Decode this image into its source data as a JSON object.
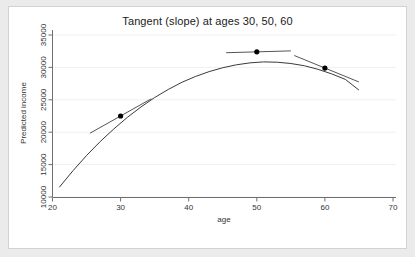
{
  "figure": {
    "background_color": "#ebebeb",
    "plot_background_color": "#ffffff",
    "border_color": "#d2d2d2"
  },
  "chart_data": {
    "type": "line",
    "title": "Tangent (slope) at ages 30, 50, 60",
    "xlabel": "age",
    "ylabel": "Predicted income",
    "xlim": [
      20,
      70
    ],
    "ylim": [
      10000,
      35000
    ],
    "xticks": [
      20,
      30,
      40,
      50,
      60,
      70
    ],
    "xtick_labels": [
      "20",
      "30",
      "40",
      "50",
      "60",
      "70"
    ],
    "yticks": [
      10000,
      15000,
      20000,
      25000,
      30000,
      35000
    ],
    "ytick_labels": [
      "10000",
      "15000",
      "20000",
      "25000",
      "30000",
      "35000"
    ],
    "grid": "horizontal",
    "legend": "none",
    "series": [
      {
        "name": "Predicted income (quadratic fit)",
        "type": "line",
        "color": "#3a3a3a",
        "x": [
          21,
          23,
          25,
          27,
          29,
          31,
          33,
          35,
          37,
          39,
          41,
          43,
          45,
          47,
          49,
          51,
          53,
          55,
          57,
          59,
          61,
          63,
          65
        ],
        "y": [
          11500,
          14050,
          16400,
          18550,
          20500,
          22300,
          23900,
          25350,
          26600,
          27700,
          28600,
          29350,
          29950,
          30400,
          30700,
          30850,
          30800,
          30600,
          30250,
          29700,
          29000,
          28150,
          26500
        ]
      }
    ],
    "markers": [
      {
        "label": "age 30",
        "x": 30,
        "y": 22500,
        "color": "#000000"
      },
      {
        "label": "age 50",
        "x": 50,
        "y": 32400,
        "color": "#000000"
      },
      {
        "label": "age 60",
        "x": 60,
        "y": 29900,
        "color": "#000000"
      }
    ],
    "tangents": [
      {
        "at_age": 30,
        "slope": 590,
        "x_start": 25.5,
        "x_end": 34.5,
        "color": "#555555"
      },
      {
        "at_age": 50,
        "slope": 30,
        "x_start": 45.5,
        "x_end": 55.0,
        "color": "#555555"
      },
      {
        "at_age": 60,
        "slope": -430,
        "x_start": 55.5,
        "x_end": 65.0,
        "color": "#555555"
      }
    ],
    "curve_fit": {
      "vertex_age": 51.5,
      "vertex_income": 32470,
      "curvature": -24.5,
      "note": "Predicted income rises with age, peaks near age 51, then declines"
    }
  }
}
